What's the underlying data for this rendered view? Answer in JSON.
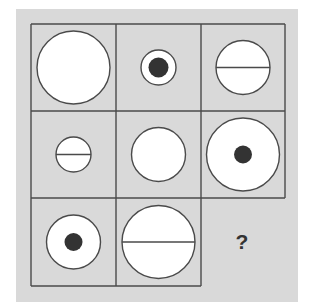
{
  "puzzle": {
    "title": "",
    "grid_rows": 3,
    "grid_cols": 3,
    "colors": {
      "background": "#d9d9d9",
      "line": "#4a4a4a",
      "circle_fill": "#ffffff",
      "dot": "#333333"
    },
    "cells": [
      {
        "row": 1,
        "col": 1,
        "size": "large",
        "mark": "none"
      },
      {
        "row": 1,
        "col": 2,
        "size": "small",
        "mark": "dot"
      },
      {
        "row": 1,
        "col": 3,
        "size": "medium",
        "mark": "line"
      },
      {
        "row": 2,
        "col": 1,
        "size": "small",
        "mark": "line"
      },
      {
        "row": 2,
        "col": 2,
        "size": "medium",
        "mark": "none"
      },
      {
        "row": 2,
        "col": 3,
        "size": "large",
        "mark": "dot"
      },
      {
        "row": 3,
        "col": 1,
        "size": "medium",
        "mark": "dot"
      },
      {
        "row": 3,
        "col": 2,
        "size": "large",
        "mark": "line"
      },
      {
        "row": 3,
        "col": 3,
        "size": "unknown",
        "mark": "question"
      }
    ],
    "question_mark": "?"
  }
}
